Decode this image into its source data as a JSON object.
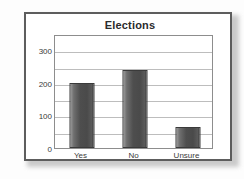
{
  "chart_data": {
    "type": "bar",
    "title": "Elections",
    "categories": [
      "Yes",
      "No",
      "Unsure"
    ],
    "values": [
      200,
      240,
      65
    ],
    "xlabel": "",
    "ylabel": "",
    "ylim": [
      0,
      350
    ],
    "yticks": [
      0,
      100,
      200,
      300
    ],
    "ytick_labels": [
      "0",
      "100",
      "200",
      "300"
    ],
    "gridlines": [
      0,
      50,
      100,
      150,
      200,
      250,
      300,
      350
    ],
    "grid": true,
    "legend": false,
    "series": [
      {
        "name": "Responses",
        "values": [
          200,
          240,
          65
        ]
      }
    ],
    "colors": {
      "bar_fill_light": "#9a9a9a",
      "bar_fill_dark": "#4a4a4a",
      "bar_edge": "#3a3a3a",
      "gridline": "#bdbdbd",
      "plot_border": "#8d8d8d",
      "frame_border": "#5d5d5d",
      "title_color": "#2b2b2b",
      "tick_color": "#3a3a3a",
      "background": "#ffffff"
    }
  }
}
